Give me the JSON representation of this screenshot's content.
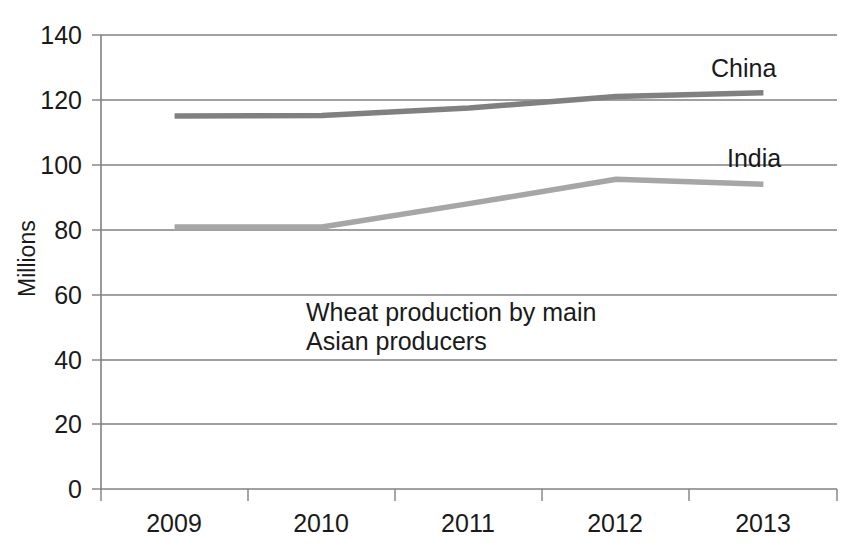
{
  "chart_data": {
    "type": "line",
    "title": "",
    "annotation": "Wheat production by main\nAsian producers",
    "xlabel": "",
    "ylabel": "Millions",
    "categories": [
      "2009",
      "2010",
      "2011",
      "2012",
      "2013"
    ],
    "series": [
      {
        "name": "China",
        "color": "#808080",
        "values": [
          115,
          115.2,
          117.5,
          121,
          122.2
        ]
      },
      {
        "name": "India",
        "color": "#a6a6a6",
        "values": [
          80.8,
          80.8,
          88,
          95.5,
          94
        ]
      }
    ],
    "ylim": [
      0,
      140
    ],
    "yticks": [
      0,
      20,
      40,
      60,
      80,
      100,
      120,
      140
    ],
    "ytick_labels": [
      "0",
      "20",
      "40",
      "60",
      "80",
      "100",
      "120",
      "140"
    ],
    "grid": "horizontal",
    "legend": "direct-labels-right",
    "axis_color": "#808080",
    "text_color": "#1a1a1a"
  },
  "labels": {
    "series_china": "China",
    "series_india": "India",
    "y_axis_title": "Millions",
    "annotation_line1": "Wheat production by main",
    "annotation_line2": "Asian producers"
  }
}
